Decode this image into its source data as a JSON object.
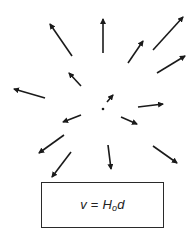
{
  "diagram": {
    "colors": {
      "arrow": "#1a1a1a",
      "box_border": "#2a2a2a",
      "text": "#222222",
      "background": "#ffffff"
    },
    "center_dot": {
      "x": 103,
      "y": 109,
      "r": 1.3
    },
    "arrows": [
      {
        "id": "upper-left-long",
        "x1": 72,
        "y1": 56,
        "x2": 50,
        "y2": 24
      },
      {
        "id": "up",
        "x1": 103,
        "y1": 53,
        "x2": 103,
        "y2": 19
      },
      {
        "id": "upper-right-short",
        "x1": 128,
        "y1": 63,
        "x2": 143,
        "y2": 41
      },
      {
        "id": "upper-right-long",
        "x1": 153,
        "y1": 50,
        "x2": 183,
        "y2": 17
      },
      {
        "id": "right-upper",
        "x1": 157,
        "y1": 73,
        "x2": 185,
        "y2": 56
      },
      {
        "id": "left-upper-short",
        "x1": 81,
        "y1": 86,
        "x2": 69,
        "y2": 73
      },
      {
        "id": "left",
        "x1": 45,
        "y1": 98,
        "x2": 14,
        "y2": 89
      },
      {
        "id": "near-center",
        "x1": 107,
        "y1": 102,
        "x2": 113,
        "y2": 95
      },
      {
        "id": "right",
        "x1": 138,
        "y1": 107,
        "x2": 163,
        "y2": 104
      },
      {
        "id": "left-lower-short",
        "x1": 81,
        "y1": 115,
        "x2": 63,
        "y2": 122
      },
      {
        "id": "right-lower-short",
        "x1": 121,
        "y1": 117,
        "x2": 137,
        "y2": 124
      },
      {
        "id": "lower-left",
        "x1": 64,
        "y1": 135,
        "x2": 39,
        "y2": 153
      },
      {
        "id": "down-left-long",
        "x1": 71,
        "y1": 152,
        "x2": 52,
        "y2": 177
      },
      {
        "id": "down",
        "x1": 108,
        "y1": 145,
        "x2": 111,
        "y2": 169
      },
      {
        "id": "lower-right",
        "x1": 153,
        "y1": 146,
        "x2": 177,
        "y2": 163
      }
    ],
    "equation": {
      "lhs": "v",
      "equals": " = ",
      "constant": "H",
      "constant_subscript": "o",
      "variable": "d"
    }
  }
}
